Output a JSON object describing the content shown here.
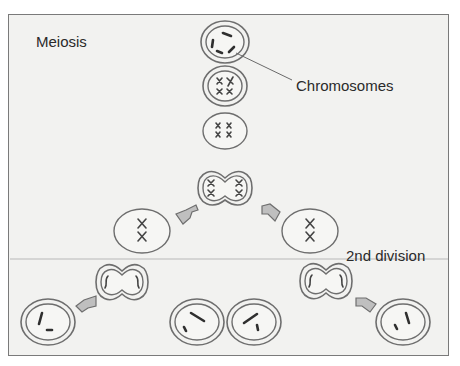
{
  "diagram": {
    "title": "Meiosis",
    "labels": {
      "chromosomes": "Chromosomes",
      "second_division": "2nd division"
    },
    "stages": [
      {
        "name": "interphase-cell",
        "description": "cell with nucleus and scattered chromosomes"
      },
      {
        "name": "prophase-cell",
        "description": "cell with condensed paired chromosomes"
      },
      {
        "name": "metaphase-cell",
        "description": "cell with 4 X-shaped chromosomes"
      },
      {
        "name": "anaphase-I-cell",
        "description": "pinching cell, chromosomes separating"
      },
      {
        "name": "daughter-cell-left",
        "description": "cell with 2 X chromosomes"
      },
      {
        "name": "daughter-cell-right",
        "description": "cell with 2 X chromosomes"
      },
      {
        "name": "dividing-cell-left",
        "description": "2nd division pinching cell"
      },
      {
        "name": "dividing-cell-right",
        "description": "2nd division pinching cell"
      },
      {
        "name": "gamete-1",
        "description": "final cell"
      },
      {
        "name": "gamete-2",
        "description": "final cell"
      },
      {
        "name": "gamete-3",
        "description": "final cell"
      },
      {
        "name": "gamete-4",
        "description": "final cell"
      }
    ],
    "colors": {
      "background": "#f2f2f0",
      "border": "#7a7a7a",
      "stroke": "#6e6e6e",
      "arrow_fill": "#bfbfbf",
      "text": "#2a2a2a"
    }
  }
}
